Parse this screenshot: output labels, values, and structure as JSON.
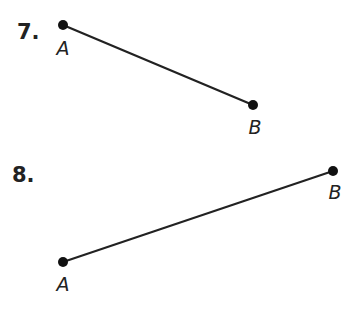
{
  "problems": [
    {
      "number": "7.",
      "segment": {
        "start": {
          "label": "A",
          "x": 63,
          "y": 25
        },
        "end": {
          "label": "B",
          "x": 253,
          "y": 105
        }
      }
    },
    {
      "number": "8.",
      "segment": {
        "start": {
          "label": "A",
          "x": 63,
          "y": 262
        },
        "end": {
          "label": "B",
          "x": 333,
          "y": 171
        }
      }
    }
  ],
  "colors": {
    "ink": "#222222",
    "background": "#ffffff"
  }
}
